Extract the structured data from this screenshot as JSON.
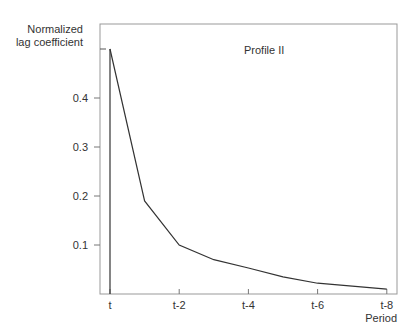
{
  "chart_data": {
    "type": "line",
    "title": "Profile II",
    "xlabel": "Period",
    "ylabel": "Normalized lag coefficient",
    "ylabel_lines": [
      "Normalized",
      "lag coefficient"
    ],
    "x": [
      "t",
      "t-1",
      "t-2",
      "t-3",
      "t-4",
      "t-5",
      "t-6",
      "t-7",
      "t-8"
    ],
    "x_tick_labels": [
      "t",
      "t-2",
      "t-4",
      "t-6",
      "t-8"
    ],
    "y_tick_labels": [
      "0.1",
      "0.2",
      "0.3",
      "0.4"
    ],
    "series": [
      {
        "name": "Profile II",
        "values": [
          0.5,
          0.19,
          0.1,
          0.07,
          0.053,
          0.035,
          0.022,
          0.016,
          0.01
        ]
      }
    ],
    "ylim": [
      0,
      0.55
    ],
    "grid": false,
    "legend": "none"
  }
}
